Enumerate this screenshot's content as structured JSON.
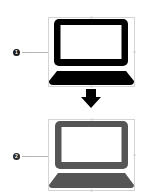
{
  "diagram": {
    "steps": [
      {
        "badge": "1",
        "icon": "laptop-icon",
        "fill_color": "#000000",
        "badge_color": "#1a1a1a",
        "screen_color": "#ffffff"
      },
      {
        "badge": "2",
        "icon": "laptop-icon",
        "fill_color": "#555555",
        "badge_color": "#2a2a2a",
        "screen_color": "#ffffff"
      }
    ],
    "connector": {
      "icon": "arrow-down-icon",
      "color": "#000000"
    },
    "colors": {
      "bounding_box": "#d4d4d4",
      "leader_line": "#b5b5b5",
      "background": "#ffffff"
    }
  }
}
